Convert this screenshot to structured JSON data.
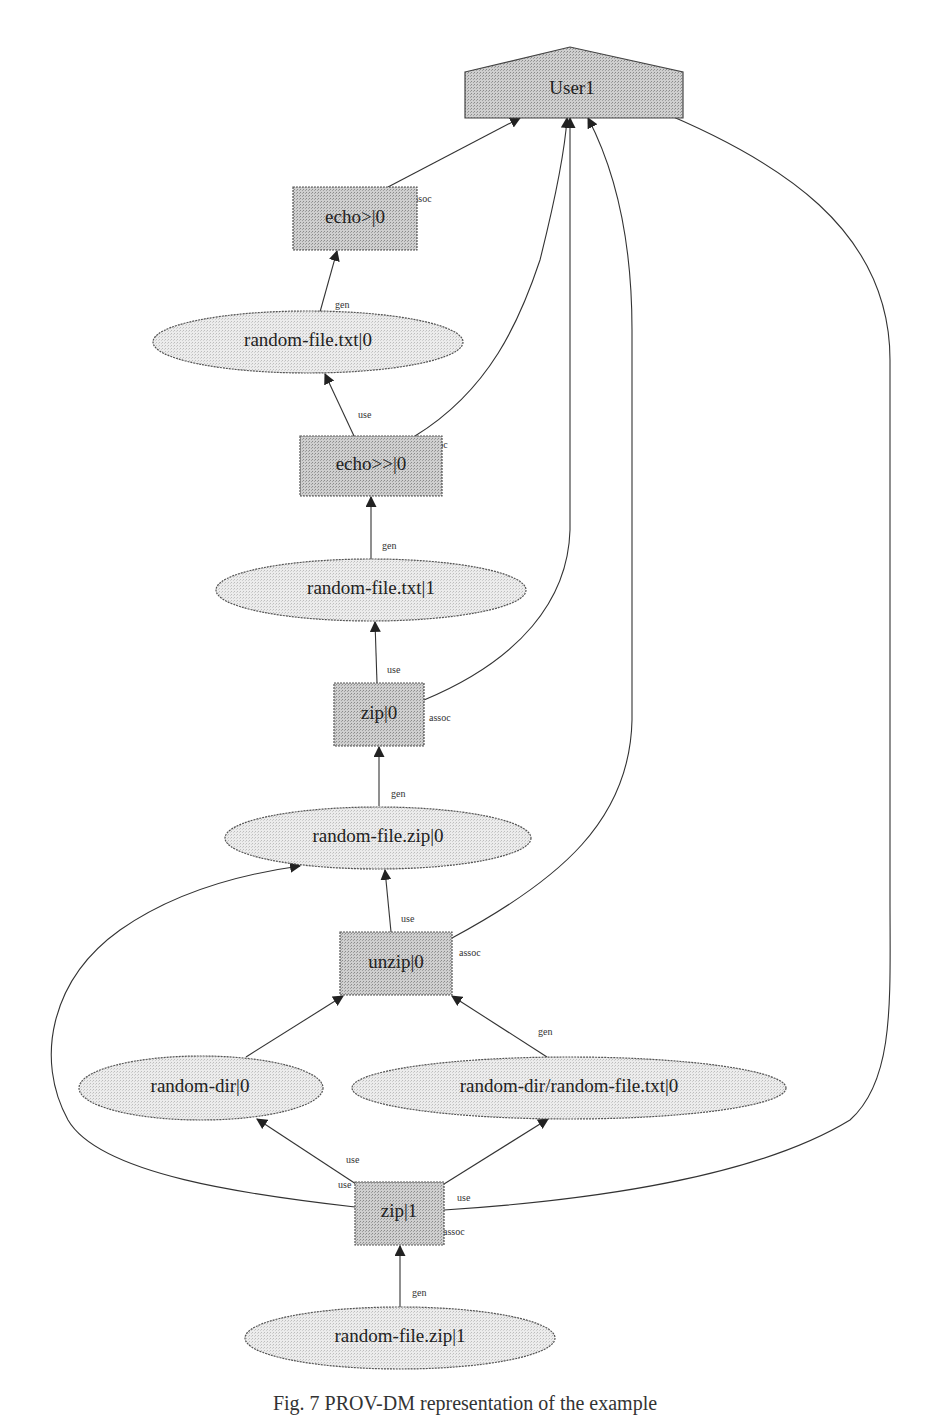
{
  "diagram": {
    "type": "provenance-graph",
    "nodes": {
      "user1": {
        "label": "User1",
        "kind": "agent"
      },
      "echo_gt_0": {
        "label": "echo>|0",
        "kind": "activity"
      },
      "random_file_txt_0": {
        "label": "random-file.txt|0",
        "kind": "entity"
      },
      "echo_gtgt_0": {
        "label": "echo>>|0",
        "kind": "activity"
      },
      "random_file_txt_1": {
        "label": "random-file.txt|1",
        "kind": "entity"
      },
      "zip_0": {
        "label": "zip|0",
        "kind": "activity"
      },
      "random_file_zip_0": {
        "label": "random-file.zip|0",
        "kind": "entity"
      },
      "unzip_0": {
        "label": "unzip|0",
        "kind": "activity"
      },
      "random_dir_0": {
        "label": "random-dir|0",
        "kind": "entity"
      },
      "random_dir_file_txt_0": {
        "label": "random-dir/random-file.txt|0",
        "kind": "entity"
      },
      "zip_1": {
        "label": "zip|1",
        "kind": "activity"
      },
      "random_file_zip_1": {
        "label": "random-file.zip|1",
        "kind": "entity"
      }
    },
    "edges": [
      {
        "from": "echo>|0",
        "to": "User1",
        "label": "assoc"
      },
      {
        "from": "random-file.txt|0",
        "to": "echo>|0",
        "label": "gen"
      },
      {
        "from": "echo>>|0",
        "to": "random-file.txt|0",
        "label": "use"
      },
      {
        "from": "echo>>|0",
        "to": "User1",
        "label": "assoc"
      },
      {
        "from": "random-file.txt|1",
        "to": "echo>>|0",
        "label": "gen"
      },
      {
        "from": "zip|0",
        "to": "random-file.txt|1",
        "label": "use"
      },
      {
        "from": "zip|0",
        "to": "User1",
        "label": "assoc"
      },
      {
        "from": "random-file.zip|0",
        "to": "zip|0",
        "label": "gen"
      },
      {
        "from": "unzip|0",
        "to": "random-file.zip|0",
        "label": "use"
      },
      {
        "from": "unzip|0",
        "to": "User1",
        "label": "assoc"
      },
      {
        "from": "random-dir|0",
        "to": "unzip|0",
        "label": "gen"
      },
      {
        "from": "random-dir/random-file.txt|0",
        "to": "unzip|0",
        "label": "gen"
      },
      {
        "from": "zip|1",
        "to": "random-dir|0",
        "label": "use"
      },
      {
        "from": "zip|1",
        "to": "random-dir/random-file.txt|0",
        "label": "use"
      },
      {
        "from": "zip|1",
        "to": "random-file.zip|0",
        "label": "use"
      },
      {
        "from": "zip|1",
        "to": "User1",
        "label": "assoc"
      },
      {
        "from": "random-file.zip|1",
        "to": "zip|1",
        "label": "gen"
      }
    ],
    "edge_labels": {
      "assoc": "assoc",
      "gen": "gen",
      "use": "use"
    }
  },
  "caption": "Fig. 7 PROV-DM representation of the example"
}
